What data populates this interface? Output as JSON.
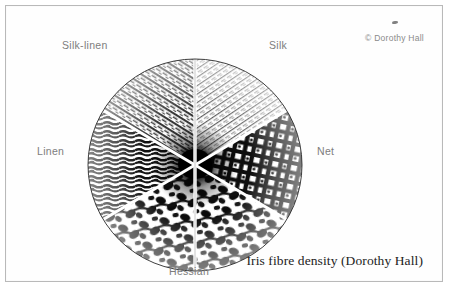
{
  "figure": {
    "caption": "Iris fibre density (Dorothy Hall)",
    "credit": "© Dorothy Hall",
    "speck_name": "scan-speck"
  },
  "diagram": {
    "shape": "circle",
    "sector_count": 6,
    "divider_color": "#ffffff",
    "ink_color": "#101010",
    "paper_color": "#ffffff",
    "labels": [
      {
        "key": "silk_linen",
        "text": "Silk-linen",
        "position": "upper-left"
      },
      {
        "key": "silk",
        "text": "Silk",
        "position": "upper-right"
      },
      {
        "key": "linen",
        "text": "Linen",
        "position": "left"
      },
      {
        "key": "net",
        "text": "Net",
        "position": "right"
      },
      {
        "key": "hessian",
        "text": "Hessian",
        "position": "bottom"
      }
    ],
    "sectors": [
      {
        "key": "silk",
        "label": "Silk",
        "density": "very-fine",
        "texture": "fine-radial-striations"
      },
      {
        "key": "net",
        "label": "Net",
        "density": "coarse",
        "texture": "open-mesh-net"
      },
      {
        "key": "hessian",
        "label": "Hessian",
        "density": "very-coarse",
        "texture": "coarse-woven-clumps"
      },
      {
        "key": "linen",
        "label": "Linen",
        "density": "medium",
        "texture": "wavy-linen-strands"
      },
      {
        "key": "silk_linen",
        "label": "Silk-linen",
        "density": "fine-medium",
        "texture": "mixed-radial-fibres"
      }
    ]
  },
  "colors": {
    "frame_border": "#b9b9b9",
    "label_text": "#7d7d7d",
    "caption_text": "#1c1c1c",
    "credit_text": "#8a8a8a",
    "page": "#fefefe"
  }
}
